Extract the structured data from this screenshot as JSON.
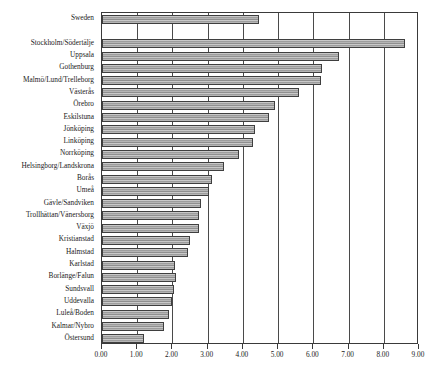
{
  "chart_data": {
    "type": "bar",
    "orientation": "horizontal",
    "title": "",
    "subtitle": "",
    "xlabel": "",
    "ylabel": "",
    "xlim": [
      0,
      9
    ],
    "ylim": null,
    "grid": true,
    "legend": null,
    "legend_position": "none",
    "xtick_labels": [
      "0.00",
      "1.00",
      "2.00",
      "3.00",
      "4.00",
      "5.00",
      "6.00",
      "7.00",
      "8.00",
      "9.00"
    ],
    "xtick_values": [
      0,
      1,
      2,
      3,
      4,
      5,
      6,
      7,
      8,
      9
    ],
    "categories": [
      "Sweden",
      "",
      "Stockholm/Södertälje",
      "Uppsala",
      "Gothenburg",
      "Malmö/Lund/Trelleborg",
      "Västerås",
      "Örebro",
      "Eskilstuna",
      "Jönköping",
      "Linköping",
      "Norrköping",
      "Helsingborg/Landskrona",
      "Borås",
      "Umeå",
      "Gävle/Sandviken",
      "Trollhättan/Vänersborg",
      "Växjö",
      "Kristianstad",
      "Halmstad",
      "Karlstad",
      "Borlänge/Falun",
      "Sundsvall",
      "Uddevalla",
      "Luleå/Boden",
      "Kalmar/Nybro",
      "Östersund"
    ],
    "values": [
      4.46,
      null,
      8.61,
      6.73,
      6.25,
      6.22,
      5.6,
      4.91,
      4.74,
      4.34,
      4.29,
      3.89,
      3.47,
      3.13,
      3.03,
      2.81,
      2.75,
      2.75,
      2.5,
      2.45,
      2.07,
      2.1,
      2.05,
      1.99,
      1.9,
      1.76,
      1.19
    ]
  },
  "colors": {
    "bar_fill": "#a8a8a8",
    "bar_border": "#3f3f3f",
    "axis": "#3a3a3a",
    "gridline": "#4a4a4a",
    "text": "#1a1a1a",
    "background": "#ffffff"
  }
}
